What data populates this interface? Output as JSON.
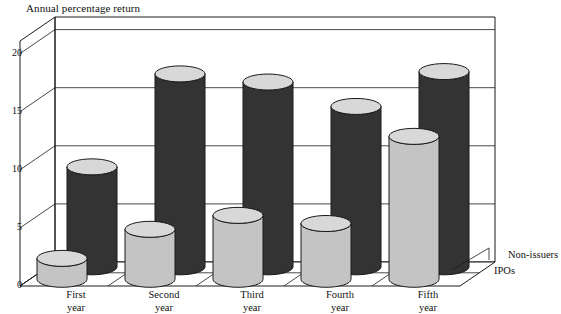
{
  "chart_data": {
    "type": "bar",
    "title": "Annual percentage return",
    "xlabel": "",
    "ylabel": "Annual percentage return",
    "categories": [
      "First year",
      "Second year",
      "Third year",
      "Fourth year",
      "Fifth year"
    ],
    "category_lines": [
      [
        "First",
        "year"
      ],
      [
        "Second",
        "year"
      ],
      [
        "Third",
        "year"
      ],
      [
        "Fourth",
        "year"
      ],
      [
        "Fifth",
        "year"
      ]
    ],
    "series": [
      {
        "name": "Non-issuers",
        "color": "#333333",
        "values": [
          8.6,
          16.6,
          15.9,
          13.8,
          16.8
        ]
      },
      {
        "name": "IPOs",
        "color": "#c4c4c4",
        "values": [
          1.8,
          4.3,
          5.5,
          4.8,
          12.3
        ]
      }
    ],
    "ylim": [
      0,
      20
    ],
    "yticks": [
      0,
      5,
      10,
      15,
      20
    ],
    "ytick_labels": [
      "0",
      "5",
      "10",
      "15",
      "20"
    ],
    "grid": true,
    "legend_position": "right",
    "style": "3d-cylinder"
  },
  "axis": {
    "y_axis_title": "Annual percentage return"
  },
  "legend": {
    "back_label": "Non-issuers",
    "front_label": "IPOs"
  },
  "colors": {
    "dark_body": "#333333",
    "dark_top": "#d8d8d8",
    "light_body": "#c4c4c4",
    "light_top": "#d8d8d8",
    "outline": "#1a1a1a",
    "floor": "#ffffff",
    "wall": "#ffffff"
  }
}
